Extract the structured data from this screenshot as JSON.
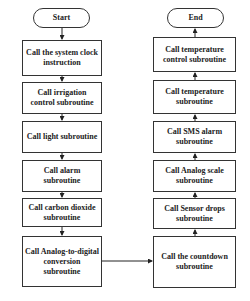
{
  "left_column": {
    "start": "Start",
    "steps": [
      "Call the system clock instruction",
      "Call irrigation control subroutine",
      "Call light subroutine",
      "Call alarm subroutine",
      "Call carbon dioxide subroutine",
      "Call Analog-to-digital conversion subroutine"
    ]
  },
  "right_column": {
    "end": "End",
    "steps": [
      "Call temperature control subroutine",
      "Call temperature subroutine",
      "Call SMS alarm subroutine",
      "Call Analog scale subroutine",
      "Call Sensor drops subroutine",
      "Call the countdown subroutine"
    ]
  },
  "colors": {
    "stroke": "#333333",
    "background": "#ffffff"
  }
}
